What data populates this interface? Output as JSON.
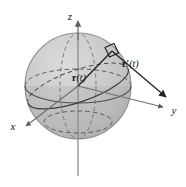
{
  "figure": {
    "kind": "math-diagram",
    "canvas": {
      "width": 186,
      "height": 187,
      "background": "#ffffff"
    },
    "colors": {
      "sphere_light": "#cfcfcf",
      "sphere_mid": "#c2c2c2",
      "sphere_shadow": "#b2b2b2",
      "sphere_edge": "#8d8d8d",
      "axis": "#7a7a7a",
      "curve": "#4a4a4a",
      "vector": "#222222",
      "text": "#111111"
    },
    "sphere": {
      "cx": 78,
      "cy": 86,
      "r": 53
    },
    "axes": [
      {
        "id": "z",
        "label": "z",
        "label_x": 72,
        "label_y": 17,
        "from": {
          "x": 78,
          "y": 175
        },
        "to": {
          "x": 78,
          "y": 20
        },
        "arrow": true
      },
      {
        "id": "y",
        "label": "y",
        "label_x": 171,
        "label_y": 116,
        "from": {
          "x": 78,
          "y": 86
        },
        "to": {
          "x": 166,
          "y": 108
        },
        "arrow": true
      },
      {
        "id": "x",
        "label": "x",
        "label_x": 12,
        "label_y": 131,
        "from": {
          "x": 78,
          "y": 86
        },
        "to": {
          "x": 24,
          "y": 127
        },
        "arrow": true
      }
    ],
    "vectors": [
      {
        "id": "position",
        "name": "r(t)",
        "bold_part": "r",
        "prime": "",
        "arg": "(t)",
        "label_x": 74,
        "label_y": 80,
        "from": {
          "x": 78,
          "y": 86
        },
        "to": {
          "x": 113,
          "y": 50
        }
      },
      {
        "id": "velocity",
        "name": "r'(t)",
        "bold_part": "r",
        "prime": "′",
        "arg": "(t)",
        "label_x": 124,
        "label_y": 66,
        "from": {
          "x": 113,
          "y": 50
        },
        "to": {
          "x": 169,
          "y": 99
        }
      }
    ],
    "right_angle_marker": {
      "name": "right-angle-marker",
      "points": "106,47 115,44 119,53 110,56"
    },
    "curves": [
      {
        "id": "equator-front",
        "style": "solid",
        "name": "equator-front-arc"
      },
      {
        "id": "equator-back",
        "style": "dashed",
        "name": "equator-back-arc"
      },
      {
        "id": "orbit-path",
        "style": "solid",
        "name": "tilted-great-circle-path"
      },
      {
        "id": "orbit-path-back",
        "style": "dashed",
        "name": "tilted-great-circle-back"
      },
      {
        "id": "lower-latitude",
        "style": "dashed",
        "name": "lower-latitude-circle"
      },
      {
        "id": "meridian-back",
        "style": "dashed",
        "name": "vertical-meridian-back"
      }
    ]
  }
}
